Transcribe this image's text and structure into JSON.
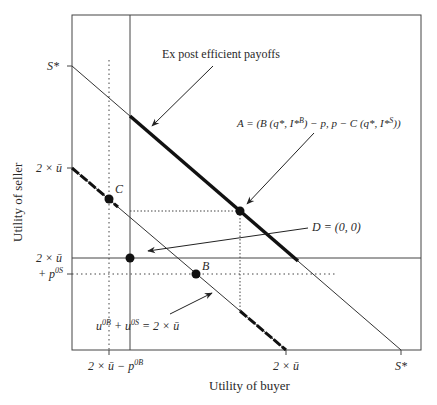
{
  "figure": {
    "x_axis_label": "Utility of buyer",
    "y_axis_label": "Utility of seller",
    "y_ticks": [
      {
        "id": "s_star",
        "label": "S*",
        "y": 66
      },
      {
        "id": "two_u",
        "label": "2 × ū",
        "y": 168
      },
      {
        "id": "two_u_p0s_line1",
        "label": "2 × ū",
        "y": 258
      },
      {
        "id": "two_u_p0s_line2",
        "label": "+ p",
        "sup": "0S",
        "y": 274
      }
    ],
    "x_ticks": [
      {
        "id": "two_u_minus_p0b",
        "label": "2 × ū − p",
        "sup": "0B",
        "x": 109
      },
      {
        "id": "two_u",
        "label": "2 × ū",
        "x": 286
      },
      {
        "id": "s_star",
        "label": "S*",
        "x": 401
      }
    ],
    "annotations": {
      "efficient": "Ex post efficient payoffs",
      "point_a": "A = (B (q*, I*B) − p, p − C (q*, I*S))",
      "point_d": "D = (0, 0)",
      "constraint": "u0B + u0S = 2 × ū"
    },
    "points": [
      {
        "label": "C",
        "x": 109,
        "y": 199
      },
      {
        "label": "A",
        "x": 240,
        "y": 211
      },
      {
        "label": "D",
        "x": 130,
        "y": 258
      },
      {
        "label": "B",
        "x": 196,
        "y": 274
      }
    ],
    "colors": {
      "line": "#333333",
      "background": "#ffffff"
    }
  }
}
